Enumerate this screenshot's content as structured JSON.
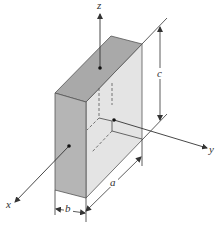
{
  "diagram": {
    "axes": [
      {
        "name": "x",
        "label": "x"
      },
      {
        "name": "y",
        "label": "y"
      },
      {
        "name": "z",
        "label": "z"
      }
    ],
    "dimensions": [
      {
        "name": "a",
        "label": "a"
      },
      {
        "name": "b",
        "label": "b"
      },
      {
        "name": "c",
        "label": "c"
      }
    ],
    "colors": {
      "top_face": "#a9a9a9",
      "front_face": "#b5b5b5",
      "side_face": "#e4e4e4",
      "line": "#333333"
    }
  }
}
